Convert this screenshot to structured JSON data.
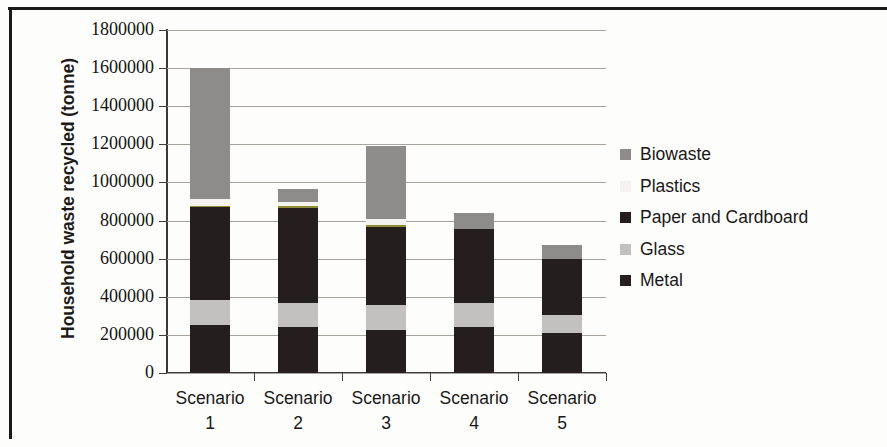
{
  "chart_data": {
    "type": "bar",
    "stacked": true,
    "title": "",
    "xlabel": "",
    "ylabel": "Household waste recycled (tonne)",
    "categories": [
      "Scenario 1",
      "Scenario 2",
      "Scenario 3",
      "Scenario 4",
      "Scenario 5"
    ],
    "category_lines": [
      {
        "word": "Scenario",
        "num": "1"
      },
      {
        "word": "Scenario",
        "num": "2"
      },
      {
        "word": "Scenario",
        "num": "3"
      },
      {
        "word": "Scenario",
        "num": "4"
      },
      {
        "word": "Scenario",
        "num": "5"
      }
    ],
    "ylim": [
      0,
      1800000
    ],
    "ytick_step": 200000,
    "ytick_labels": [
      "1800000",
      "1600000",
      "1400000",
      "1200000",
      "1000000",
      "800000",
      "600000",
      "400000",
      "200000",
      "0"
    ],
    "ytick_values": [
      1800000,
      1600000,
      1400000,
      1200000,
      1000000,
      800000,
      600000,
      400000,
      200000,
      0
    ],
    "grid": true,
    "legend_position": "right",
    "series": [
      {
        "name": "Biowaste",
        "color": "#8e8c89",
        "values": [
          687000,
          68000,
          385000,
          84000,
          73000
        ]
      },
      {
        "name": "Plastics",
        "color": "#f4f3f0",
        "values": [
          42000,
          31000,
          41000,
          0,
          0
        ]
      },
      {
        "name": "Paper and Cardboard",
        "color": "#241f1c",
        "values": [
          488000,
          499000,
          410000,
          388000,
          294000
        ]
      },
      {
        "name": "Glass",
        "color": "#c3c1bd",
        "values": [
          131000,
          126000,
          131000,
          126000,
          94000
        ]
      },
      {
        "name": "Metal",
        "color": "#241f1c",
        "values": [
          252000,
          241000,
          226000,
          241000,
          210000
        ]
      }
    ],
    "totals": [
      1600000,
      965000,
      1193000,
      839000,
      671000
    ],
    "legend_entries": [
      {
        "label": "Biowaste",
        "color": "#8e8c89"
      },
      {
        "label": "Plastics",
        "color": "#f4f3f0"
      },
      {
        "label": "Paper and Cardboard",
        "color": "#241f1c"
      },
      {
        "label": "Glass",
        "color": "#c3c1bd"
      },
      {
        "label": "Metal",
        "color": "#241f1c"
      }
    ]
  }
}
